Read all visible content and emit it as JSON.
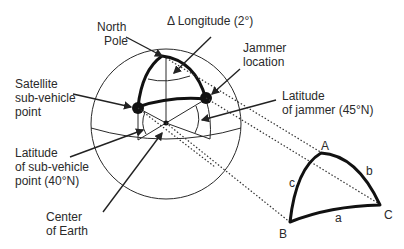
{
  "labels": {
    "north_pole": [
      "North",
      "Pole"
    ],
    "delta_longitude": "Δ Longitude (2°)",
    "jammer_location": [
      "Jammer",
      "location"
    ],
    "satellite_point": [
      "Satellite",
      "sub-vehicle",
      "point"
    ],
    "latitude_jammer": [
      "Latitude",
      "of jammer (45°N)"
    ],
    "latitude_subvehicle": [
      "Latitude",
      "of sub-vehicle",
      "point (40°N)"
    ],
    "center_of_earth": [
      "Center",
      "of Earth"
    ]
  },
  "triangle": {
    "vertices": {
      "A": "A",
      "B": "B",
      "C": "C"
    },
    "sides": {
      "a": "a",
      "b": "b",
      "c": "c"
    }
  }
}
